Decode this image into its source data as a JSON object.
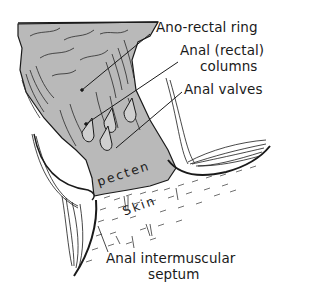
{
  "figure": {
    "colors": {
      "mucosa_gray": "#b9b9b9",
      "ink": "#1a1a1a",
      "background": "#ffffff"
    }
  },
  "labels": {
    "anorectal_ring": "Ano-rectal ring",
    "anal_columns_line1": "Anal (rectal)",
    "anal_columns_line2": "columns",
    "anal_valves": "Anal valves",
    "septum_line1": "Anal intermuscular",
    "septum_line2": "septum"
  },
  "region_labels": {
    "pecten": "pecten",
    "skin": "Skin"
  }
}
